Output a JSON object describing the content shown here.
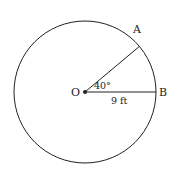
{
  "diagram": {
    "type": "circle-sector",
    "center": {
      "label": "O",
      "x": 85,
      "y": 92
    },
    "radius_px": 71,
    "points": [
      {
        "label": "A",
        "angle_deg": 40
      },
      {
        "label": "B",
        "angle_deg": 0
      }
    ],
    "angle_label": "40°",
    "radius_label": "9 ft",
    "colors": {
      "stroke": "#222222",
      "background": "#ffffff"
    }
  }
}
